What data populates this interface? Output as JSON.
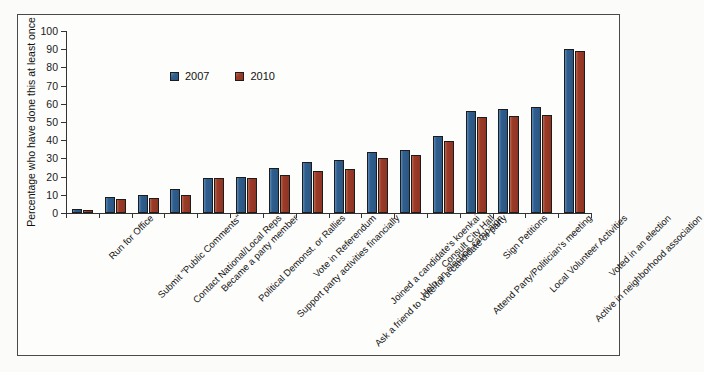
{
  "chart_data": {
    "type": "bar",
    "title": "",
    "subtitle": "",
    "xlabel": "",
    "ylabel": "Percentage who have done this at least once",
    "ylim": [
      0,
      100
    ],
    "ytick_values": [
      0,
      10,
      20,
      30,
      40,
      50,
      60,
      70,
      80,
      90,
      100
    ],
    "ytick_labels": [
      "0",
      "10",
      "20",
      "30",
      "40",
      "50",
      "60",
      "70",
      "80",
      "90",
      "100"
    ],
    "grid": false,
    "legend_position": "upper-left-inside",
    "orientation": "vertical",
    "grouping": "grouped",
    "categories": [
      "Run for Office",
      "Submit \"Public Comments\"",
      "Contact National/Local Reps",
      "Became a party member",
      "Political Demonst. or Rallies",
      "Support party activities financially",
      "Vote in Referendum",
      "Ask a friend to vote for a candidate or party",
      "Joined a candidate's koenkai",
      "Help an election campaign",
      "Consult City Hall",
      "Attend Party/Politician's meeting",
      "Sign Petitions",
      "Local Volunteer Activities",
      "Active in neighborhood association",
      "Voted in an election"
    ],
    "series": [
      {
        "name": "2007",
        "color": "#2f5f8f",
        "values": [
          2,
          9,
          10,
          13,
          19,
          20,
          25,
          28,
          29,
          33.5,
          34.5,
          42.5,
          56,
          57,
          58,
          90
        ]
      },
      {
        "name": "2010",
        "color": "#9c3b28",
        "values": [
          1.5,
          7.5,
          8.5,
          10,
          19,
          19.5,
          21,
          23,
          24,
          30,
          32,
          39.5,
          53,
          53.5,
          54,
          89
        ]
      }
    ]
  },
  "figure": {
    "border_color": "#4a4a4a",
    "background": "#fdfdfb"
  }
}
